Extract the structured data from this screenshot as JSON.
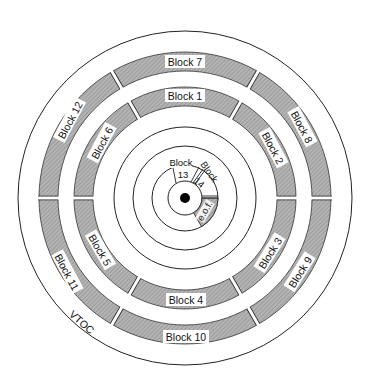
{
  "diagram": {
    "title": "",
    "colors": {
      "background": "#ffffff",
      "line": "#222222",
      "shade": "#a9a9a9",
      "shade_hatch": "#8a8a8a"
    },
    "outer_label": "VTOC",
    "outer_band": {
      "blocks": [
        {
          "id": "block-7",
          "label": "Block 7"
        },
        {
          "id": "block-8",
          "label": "Block 8"
        },
        {
          "id": "block-9",
          "label": "Block 9"
        },
        {
          "id": "block-10",
          "label": "Block 10"
        },
        {
          "id": "block-11",
          "label": "Block 11"
        },
        {
          "id": "block-12",
          "label": "Block 12"
        }
      ]
    },
    "inner_band": {
      "blocks": [
        {
          "id": "block-1",
          "label": "Block 1"
        },
        {
          "id": "block-2",
          "label": "Block 2"
        },
        {
          "id": "block-3",
          "label": "Block 3"
        },
        {
          "id": "block-4",
          "label": "Block 4"
        },
        {
          "id": "block-5",
          "label": "Block 5"
        },
        {
          "id": "block-6",
          "label": "Block 6"
        }
      ]
    },
    "center_track": {
      "block_13": {
        "word": "Block",
        "number": "13"
      },
      "block_14": {
        "word": "Block",
        "number": "14"
      },
      "eof": "e.o.f."
    }
  }
}
